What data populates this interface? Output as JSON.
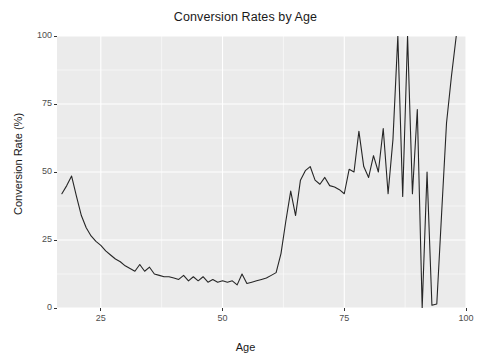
{
  "chart_data": {
    "type": "line",
    "title": "Conversion Rates by Age",
    "xlabel": "Age",
    "ylabel": "Conversion Rate (%)",
    "xlim": [
      16,
      100
    ],
    "ylim": [
      0,
      100
    ],
    "xticks": [
      25,
      50,
      75,
      100
    ],
    "yticks": [
      0,
      25,
      50,
      75,
      100
    ],
    "grid": true,
    "legend": "none",
    "line_color": "#262626",
    "panel_color": "#ebebeb",
    "grid_color": "#ffffff",
    "series": [
      {
        "name": "Conversion Rate",
        "x": [
          17,
          18,
          19,
          20,
          21,
          22,
          23,
          24,
          25,
          26,
          27,
          28,
          29,
          30,
          31,
          32,
          33,
          34,
          35,
          36,
          37,
          38,
          39,
          40,
          41,
          42,
          43,
          44,
          45,
          46,
          47,
          48,
          49,
          50,
          51,
          52,
          53,
          54,
          55,
          56,
          57,
          58,
          59,
          60,
          61,
          62,
          63,
          64,
          65,
          66,
          67,
          68,
          69,
          70,
          71,
          72,
          73,
          74,
          75,
          76,
          77,
          78,
          79,
          80,
          81,
          82,
          83,
          84,
          85,
          86,
          87,
          88,
          89,
          90,
          91,
          92,
          93,
          94,
          95,
          96,
          97,
          98
        ],
        "values": [
          42.0,
          45.0,
          48.5,
          41.0,
          34.0,
          29.5,
          26.5,
          24.5,
          23.0,
          21.0,
          19.5,
          18.0,
          17.0,
          15.5,
          14.5,
          13.5,
          16.0,
          13.5,
          15.0,
          12.5,
          12.0,
          11.5,
          11.5,
          11.0,
          10.5,
          12.0,
          10.0,
          11.5,
          10.0,
          11.5,
          9.5,
          10.5,
          9.5,
          10.0,
          9.5,
          10.0,
          8.5,
          12.5,
          9.0,
          9.5,
          10.0,
          10.5,
          11.0,
          12.0,
          13.0,
          20.0,
          32.0,
          43.0,
          34.0,
          47.0,
          50.5,
          52.0,
          47.0,
          45.5,
          48.0,
          45.0,
          44.5,
          43.5,
          42.0,
          51.0,
          50.0,
          65.0,
          52.0,
          48.0,
          56.0,
          50.0,
          66.0,
          42.0,
          62.0,
          100.0,
          41.0,
          100.0,
          42.0,
          73.0,
          0.0,
          50.0,
          1.0,
          1.5,
          35.0,
          68.0,
          85.0,
          100.0
        ]
      }
    ]
  },
  "accessibility": {
    "plot_area_name": "plot-panel"
  }
}
